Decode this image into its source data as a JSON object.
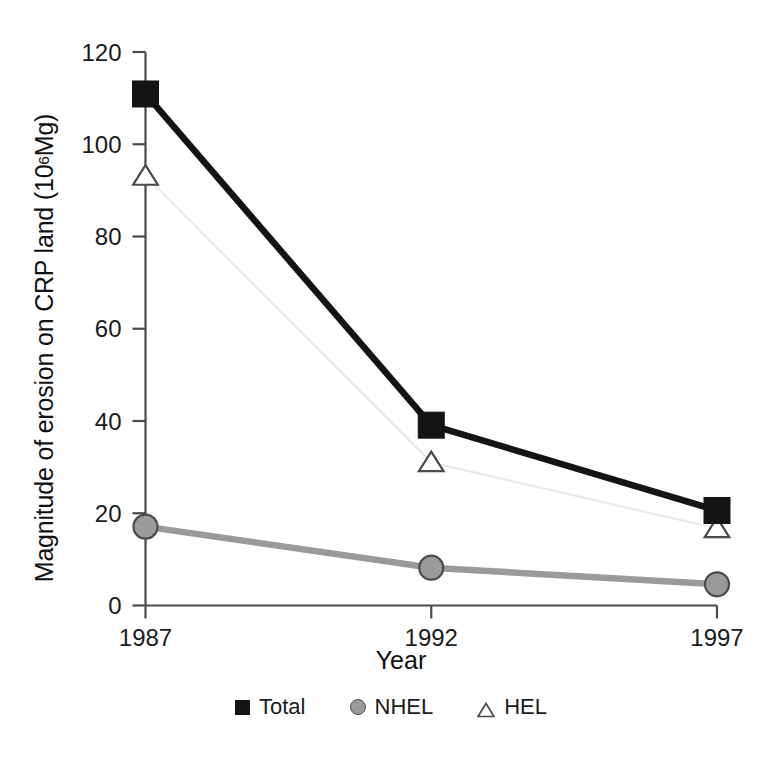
{
  "chart_data": {
    "type": "line",
    "title": "",
    "xlabel": "Year",
    "ylabel": "Magnitude of erosion on CRP land (10",
    "ylabel_sup": "6",
    "ylabel_tail": " Mg)",
    "categories": [
      "1987",
      "1992",
      "1997"
    ],
    "x": [
      1987,
      1992,
      1997
    ],
    "xlim": [
      1987,
      1997
    ],
    "ylim": [
      0,
      120
    ],
    "yticks": [
      0,
      20,
      40,
      60,
      80,
      100,
      120
    ],
    "ytick_labels": [
      "0",
      "20",
      "40",
      "60",
      "80",
      "100",
      "120"
    ],
    "xtick_labels": [
      "1987",
      "1992",
      "1997"
    ],
    "grid": false,
    "legend_position": "bottom",
    "series": [
      {
        "name": "Total",
        "marker": "square",
        "line_color": "#141414",
        "marker_fill": "#141414",
        "marker_edge": "#141414",
        "values": [
          110.9,
          39.1,
          20.6
        ]
      },
      {
        "name": "NHEL",
        "marker": "circle",
        "line_color": "#9a9a9a",
        "marker_fill": "#9a9a9a",
        "marker_edge": "#4a4a4a",
        "values": [
          17.1,
          8.2,
          4.6
        ]
      },
      {
        "name": "HEL",
        "marker": "triangle",
        "line_color": "#e9e9e9",
        "marker_fill": "#ffffff",
        "marker_edge": "#4a4a4a",
        "values": [
          93.1,
          31.0,
          16.7
        ]
      }
    ]
  },
  "axes": {
    "x_title": "Year",
    "y_title_main": "Magnitude of erosion on CRP land (10",
    "y_title_sup": "6",
    "y_title_end": " Mg)"
  },
  "legend": {
    "items": [
      {
        "label": "Total",
        "marker": "square"
      },
      {
        "label": "NHEL",
        "marker": "circle"
      },
      {
        "label": "HEL",
        "marker": "triangle"
      }
    ]
  },
  "colors": {
    "total": "#141414",
    "nhel": "#9a9a9a",
    "hel_line": "#e9e9e9",
    "hel_marker": "#ffffff",
    "axis": "#4a4a4a",
    "text": "#1a1a1a"
  }
}
